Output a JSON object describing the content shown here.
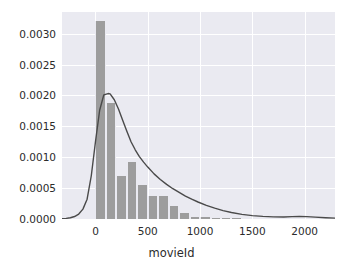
{
  "figure": {
    "background_color": "#ffffff",
    "axes_background_color": "#eaeaf1",
    "grid_color": "#ffffff",
    "bar_color": "#9d9d9d",
    "line_color": "#4a4a4a",
    "tick_text_color": "#2b2b2b"
  },
  "chart_data": {
    "type": "bar",
    "title": "",
    "subtitle": "",
    "xlabel": "movieId",
    "ylabel": "",
    "grid": true,
    "legend": null,
    "xlim": [
      -320,
      2290
    ],
    "ylim": [
      0.0,
      0.00335
    ],
    "xticks": [
      0,
      500,
      1000,
      1500,
      2000
    ],
    "xticklabels": [
      "0",
      "500",
      "1000",
      "1500",
      "2000"
    ],
    "yticks": [
      0.0,
      0.0005,
      0.001,
      0.0015,
      0.002,
      0.0025,
      0.003
    ],
    "yticklabels": [
      "0.0000",
      "0.0005",
      "0.0010",
      "0.0015",
      "0.0020",
      "0.0025",
      "0.0030"
    ],
    "bin_width": 100,
    "categories": [
      "0-100",
      "100-200",
      "200-300",
      "300-400",
      "400-500",
      "500-600",
      "600-700",
      "700-800",
      "800-900",
      "900-1000",
      "1000-1100",
      "1100-1200",
      "1200-1300",
      "1300-1400"
    ],
    "bin_edges": [
      0,
      100,
      200,
      300,
      400,
      500,
      600,
      700,
      800,
      900,
      1000,
      1100,
      1200,
      1300,
      1400
    ],
    "values": [
      0.0032,
      0.00188,
      0.0007,
      0.00093,
      0.00055,
      0.00037,
      0.00038,
      0.00021,
      0.0001,
      4e-05,
      3e-05,
      2e-05,
      1e-05,
      1e-05
    ],
    "series": [
      {
        "name": "histogram",
        "type": "bar",
        "values": [
          0.0032,
          0.00188,
          0.0007,
          0.00093,
          0.00055,
          0.00037,
          0.00038,
          0.00021,
          0.0001,
          4e-05,
          3e-05,
          2e-05,
          1e-05,
          1e-05
        ]
      },
      {
        "name": "kde",
        "type": "line",
        "x": [
          -320,
          -280,
          -240,
          -200,
          -160,
          -120,
          -80,
          -40,
          0,
          40,
          80,
          120,
          140,
          180,
          220,
          260,
          300,
          340,
          380,
          420,
          460,
          500,
          560,
          620,
          680,
          740,
          800,
          860,
          920,
          980,
          1060,
          1140,
          1220,
          1300,
          1400,
          1500,
          1600,
          1700,
          1800,
          1880,
          1950,
          2020,
          2100,
          2200,
          2290
        ],
        "y": [
          5e-06,
          1e-05,
          2e-05,
          4e-05,
          8e-05,
          0.00016,
          0.00032,
          0.0007,
          0.00125,
          0.00176,
          0.00201,
          0.00203,
          0.002025,
          0.00193,
          0.00178,
          0.0016,
          0.00142,
          0.00125,
          0.00112,
          0.00101,
          0.00092,
          0.00084,
          0.00073,
          0.00064,
          0.00056,
          0.00049,
          0.00043,
          0.00037,
          0.00032,
          0.000275,
          0.00022,
          0.000175,
          0.000135,
          0.000105,
          7.5e-05,
          5.5e-05,
          4.2e-05,
          3.5e-05,
          3.3e-05,
          3.8e-05,
          4.2e-05,
          3.8e-05,
          3e-05,
          2e-05,
          1.4e-05
        ],
        "peak_x": 140,
        "peak_y": 0.00203
      }
    ]
  }
}
